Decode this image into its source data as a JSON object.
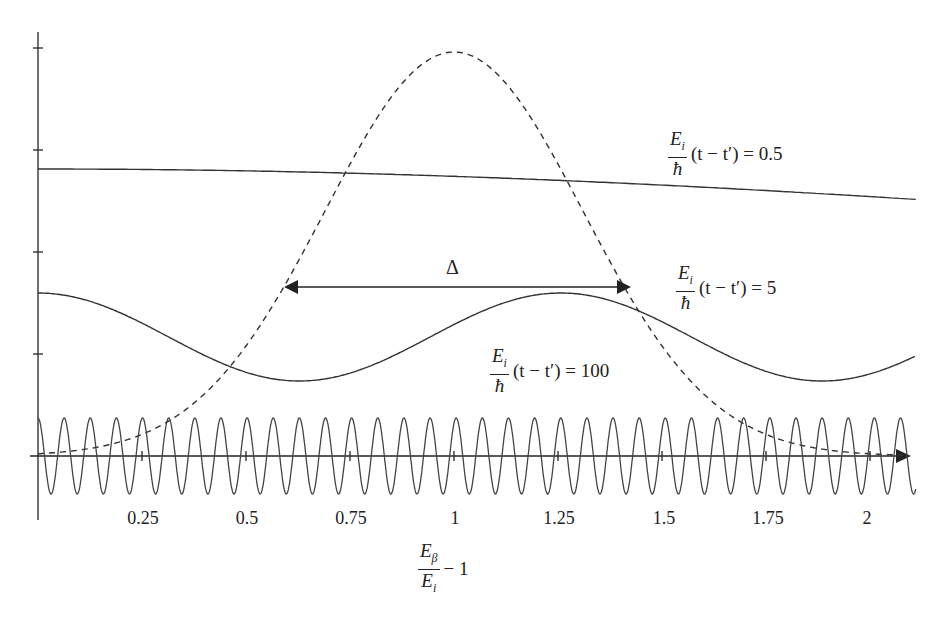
{
  "chart_data": {
    "type": "line",
    "title": "",
    "xlabel": "E_β / E_i − 1",
    "ylabel": "",
    "xlim": [
      0,
      2.1
    ],
    "x_ticks": [
      0.25,
      0.5,
      0.75,
      1,
      1.25,
      1.5,
      1.75,
      2
    ],
    "x_tick_labels": [
      "0.25",
      "0.5",
      "0.75",
      "1",
      "1.25",
      "1.5",
      "1.75",
      "2"
    ],
    "y_ticks_count": 4,
    "grid": false,
    "legend": "inline annotations",
    "series": [
      {
        "name": "Gaussian line shape (dashed)",
        "style": "dashed",
        "shape": "gaussian",
        "center": 1.0,
        "sigma": 0.31
      },
      {
        "name": "(E_i/ħ)(t − t') = 0.5",
        "style": "solid",
        "shape": "cosine",
        "k": 0.5
      },
      {
        "name": "(E_i/ħ)(t − t') = 5",
        "style": "solid",
        "shape": "cosine",
        "k": 5
      },
      {
        "name": "(E_i/ħ)(t − t') = 100",
        "style": "solid",
        "shape": "cosine",
        "k": 100
      }
    ],
    "annotations": [
      {
        "text": "Δ",
        "type": "double-arrow",
        "x_from": 0.59,
        "x_to": 1.41,
        "meaning": "width of dashed curve"
      }
    ]
  },
  "labels": {
    "tick_025": "0.25",
    "tick_05": "0.5",
    "tick_075": "0.75",
    "tick_1": "1",
    "tick_125": "1.25",
    "tick_15": "1.5",
    "tick_175": "1.75",
    "tick_2": "2",
    "delta": "Δ",
    "curve_label_num": "E",
    "curve_label_num_sub": "i",
    "curve_label_den": "ħ",
    "curve_label_expr_05": "(t − t′) = 0.5",
    "curve_label_expr_5": "(t − t′) = 5",
    "curve_label_expr_100": "(t − t′) = 100",
    "xaxis_num": "E",
    "xaxis_num_sub": "β",
    "xaxis_den": "E",
    "xaxis_den_sub": "i",
    "xaxis_suffix": "− 1"
  }
}
